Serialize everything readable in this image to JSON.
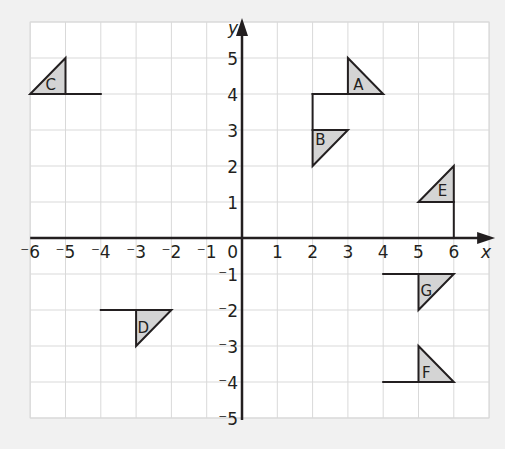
{
  "diagram": {
    "type": "coordinate-grid-transformations",
    "axes": {
      "x_label": "x",
      "y_label": "y",
      "origin_label": "0",
      "x_ticks": [
        "-6",
        "-5",
        "-4",
        "-3",
        "-2",
        "-1",
        "1",
        "2",
        "3",
        "4",
        "5",
        "6"
      ],
      "x_tick_values": [
        -6,
        -5,
        -4,
        -3,
        -2,
        -1,
        1,
        2,
        3,
        4,
        5,
        6
      ],
      "y_ticks": [
        "5",
        "4",
        "3",
        "2",
        "1",
        "-1",
        "-2",
        "-3",
        "-4",
        "-5"
      ],
      "y_tick_values": [
        5,
        4,
        3,
        2,
        1,
        -1,
        -2,
        -3,
        -4,
        -5
      ],
      "x_range": [
        -6,
        7
      ],
      "y_range": [
        -5,
        6
      ]
    },
    "colors": {
      "background": "#f1f1f1",
      "grid_bg": "#ffffff",
      "grid_line": "#d9d9d9",
      "axis": "#231f20",
      "shape_fill": "#d4d4d4",
      "shape_stroke": "#231f20"
    },
    "shapes": [
      {
        "label": "A",
        "triangle": [
          [
            3,
            4
          ],
          [
            3,
            5
          ],
          [
            4,
            4
          ]
        ],
        "stalk": [
          [
            2,
            4
          ],
          [
            3,
            4
          ],
          [
            2,
            4
          ],
          [
            2,
            3
          ]
        ],
        "label_at": [
          3.3,
          4.25
        ]
      },
      {
        "label": "B",
        "triangle": [
          [
            2,
            3
          ],
          [
            3,
            3
          ],
          [
            2,
            2
          ]
        ],
        "stalk": [],
        "label_at": [
          2.22,
          2.72
        ]
      },
      {
        "label": "C",
        "triangle": [
          [
            -6,
            4
          ],
          [
            -5,
            5
          ],
          [
            -5,
            4
          ]
        ],
        "stalk": [
          [
            -5,
            4
          ],
          [
            -4,
            4
          ]
        ],
        "label_at": [
          -5.42,
          4.25
        ]
      },
      {
        "label": "D",
        "triangle": [
          [
            -3,
            -2
          ],
          [
            -2,
            -2
          ],
          [
            -3,
            -3
          ]
        ],
        "stalk": [
          [
            -4,
            -2
          ],
          [
            -3,
            -2
          ]
        ],
        "label_at": [
          -2.8,
          -2.52
        ]
      },
      {
        "label": "E",
        "triangle": [
          [
            5,
            1
          ],
          [
            6,
            2
          ],
          [
            6,
            1
          ]
        ],
        "stalk": [
          [
            6,
            1
          ],
          [
            6,
            0
          ]
        ],
        "label_at": [
          5.68,
          1.3
        ]
      },
      {
        "label": "F",
        "triangle": [
          [
            5,
            -4
          ],
          [
            5,
            -3
          ],
          [
            6,
            -4
          ]
        ],
        "stalk": [
          [
            4,
            -4
          ],
          [
            5,
            -4
          ]
        ],
        "label_at": [
          5.22,
          -3.75
        ]
      },
      {
        "label": "G",
        "triangle": [
          [
            5,
            -1
          ],
          [
            6,
            -1
          ],
          [
            5,
            -2
          ]
        ],
        "stalk": [
          [
            4,
            -1
          ],
          [
            5,
            -1
          ]
        ],
        "label_at": [
          5.22,
          -1.48
        ]
      }
    ]
  }
}
